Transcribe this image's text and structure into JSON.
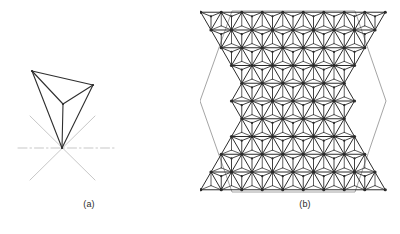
{
  "figure": {
    "title_visible": false,
    "background_color": "#ffffff",
    "panels": [
      {
        "id": "a",
        "caption": "(a)",
        "description": "single tetrahedron wireframe with dash-dot symmetry axes",
        "line_color": "#2e2e2e",
        "axis_color": "#b9b9b9",
        "shape": "tetrahedron",
        "vertices": {
          "top_left": [
            32,
            71
          ],
          "top_right": [
            93,
            85
          ],
          "mid_back": [
            63,
            104
          ],
          "apex": [
            62,
            148
          ]
        },
        "edges": [
          [
            "top_left",
            "top_right"
          ],
          [
            "top_right",
            "mid_back"
          ],
          [
            "mid_back",
            "top_left"
          ],
          [
            "top_left",
            "apex"
          ],
          [
            "top_right",
            "apex"
          ],
          [
            "mid_back",
            "apex"
          ]
        ],
        "axes": [
          {
            "name": "horizontal-axis",
            "from": [
              18,
              148
            ],
            "to": [
              116,
              148
            ],
            "style": "dash-dot"
          },
          {
            "name": "diagonal-axis-1",
            "from": [
              30,
              116
            ],
            "to": [
              95,
              180
            ],
            "style": "solid-light"
          },
          {
            "name": "diagonal-axis-2",
            "from": [
              95,
              116
            ],
            "to": [
              30,
              180
            ],
            "style": "solid-light"
          }
        ]
      },
      {
        "id": "b",
        "caption": "(b)",
        "description": "hexagonal array of tetrahedra on a triangular lattice",
        "line_color": "#2b2b2b",
        "hexagon_outline_color": "#9a9a9a",
        "hexagon": {
          "center": [
            293,
            101
          ],
          "width": 186,
          "height": 181,
          "flat_top": true,
          "vertices": [
            [
              232,
              11
            ],
            [
              355,
              11
            ],
            [
              386,
              101
            ],
            [
              355,
              192
            ],
            [
              232,
              192
            ],
            [
              200,
              101
            ]
          ]
        },
        "lattice": {
          "rows": 6,
          "cell_width": 30.8,
          "cell_height": 30.2,
          "motif": "tetrahedron",
          "node_marker": "filled-dot",
          "node_radius": 1.6
        }
      }
    ]
  }
}
